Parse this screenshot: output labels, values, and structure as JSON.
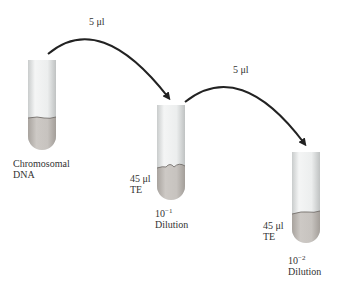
{
  "diagram": {
    "transfers": [
      {
        "label": "5 μl",
        "from": "tube-1",
        "to": "tube-2"
      },
      {
        "label": "5 μl",
        "from": "tube-2",
        "to": "tube-3"
      }
    ],
    "tubes": [
      {
        "id": "tube-1",
        "label_line1": "Chromosomal",
        "label_line2": "DNA"
      },
      {
        "id": "tube-2",
        "volume": "45 μl",
        "buffer": "TE",
        "dilution_base": "10",
        "dilution_exp": "−1",
        "dilution_word": "Dilution"
      },
      {
        "id": "tube-3",
        "volume": "45 μl",
        "buffer": "TE",
        "dilution_base": "10",
        "dilution_exp": "−2",
        "dilution_word": "Dilution"
      }
    ],
    "colors": {
      "arrow": "#222222",
      "tube_glass": "#e8eaea",
      "liquid": "#bdb8b3"
    }
  }
}
